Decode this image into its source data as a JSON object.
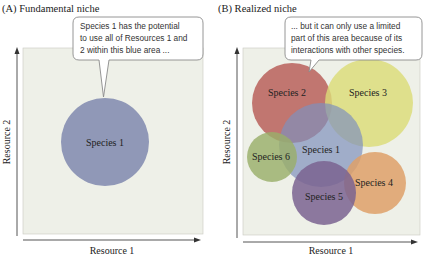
{
  "panels": {
    "a": {
      "title": "(A)  Fundamental niche",
      "callout": {
        "lines": [
          "Species 1 has the potential",
          "to use all of Resources 1 and",
          "2 within this blue area ..."
        ]
      },
      "xlabel": "Resource 1",
      "ylabel": "Resource 2",
      "species": [
        {
          "label": "Species 1",
          "color": "#8a92b4"
        }
      ]
    },
    "b": {
      "title": "(B)  Realized niche",
      "callout": {
        "lines": [
          "... but it can only use a limited",
          "part of this area because of its",
          "interactions with other species."
        ]
      },
      "xlabel": "Resource 1",
      "ylabel": "Resource 2",
      "species": [
        {
          "label": "Species 2",
          "color": "#b8605a"
        },
        {
          "label": "Species 3",
          "color": "#dcdc78"
        },
        {
          "label": "Species 1",
          "color": "#8a98bc"
        },
        {
          "label": "Species 6",
          "color": "#9aaf6a"
        },
        {
          "label": "Species 4",
          "color": "#dea068"
        },
        {
          "label": "Species 5",
          "color": "#7e6890"
        }
      ]
    }
  },
  "colors": {
    "plot_background": "#eef0e8",
    "axis": "#555555",
    "callout_border": "#8a8a8a"
  }
}
